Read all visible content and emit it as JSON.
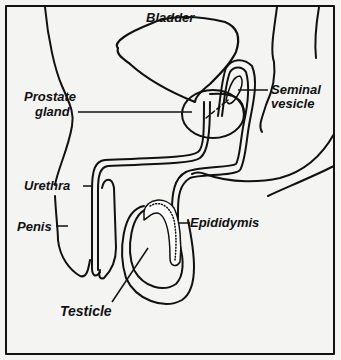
{
  "diagram": {
    "type": "anatomical illustration",
    "colors": {
      "line": "#111111",
      "background": "#f4f4f2"
    },
    "labels": {
      "bladder": "Bladder",
      "prostate_line1": "Prostate",
      "prostate_line2": "gland",
      "seminal_line1": "Seminal",
      "seminal_line2": "vesicle",
      "urethra": "Urethra",
      "penis": "Penis",
      "epididymis": "Epididymis",
      "testicle": "Testicle"
    }
  }
}
